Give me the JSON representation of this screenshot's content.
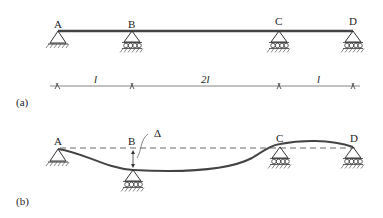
{
  "figure": {
    "part_a": {
      "caption": "(a)",
      "supports": [
        {
          "label": "A",
          "type": "pin"
        },
        {
          "label": "B",
          "type": "roller"
        },
        {
          "label": "C",
          "type": "roller"
        },
        {
          "label": "D",
          "type": "roller"
        }
      ],
      "spans": [
        {
          "label": "l"
        },
        {
          "label": "2l"
        },
        {
          "label": "l"
        }
      ]
    },
    "part_b": {
      "caption": "(b)",
      "supports": [
        {
          "label": "A",
          "type": "pin"
        },
        {
          "label": "B",
          "type": "roller (settled)"
        },
        {
          "label": "C",
          "type": "roller"
        },
        {
          "label": "D",
          "type": "roller"
        }
      ],
      "settlement_label": "Δ"
    }
  }
}
